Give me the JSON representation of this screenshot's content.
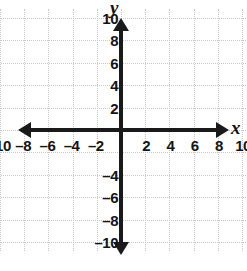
{
  "chart_data": {
    "type": "scatter",
    "title": "",
    "xlabel": "x",
    "ylabel": "y",
    "xlim": [
      -11,
      11
    ],
    "ylim": [
      -11,
      11
    ],
    "grid": true,
    "grid_step": 2,
    "legend": "none",
    "series": [],
    "x_tick_labels": [
      "–10",
      "–8",
      "–6",
      "–4",
      "–2",
      "2",
      "4",
      "6",
      "8",
      "10"
    ],
    "x_tick_values": [
      -10,
      -8,
      -6,
      -4,
      -2,
      2,
      4,
      6,
      8,
      10
    ],
    "y_tick_labels": [
      "10",
      "8",
      "6",
      "4",
      "2",
      "–4",
      "–6",
      "–8",
      "–10"
    ],
    "y_tick_values": [
      10,
      8,
      6,
      4,
      2,
      -4,
      -6,
      -8,
      -10
    ],
    "axis_color": "#1a1a1a",
    "grid_color": "#c9c9c9",
    "background": "#ffffff"
  },
  "axes": {
    "x_label": "x",
    "y_label": "y"
  },
  "ticks": {
    "x": [
      {
        "label": "–10",
        "value": -10
      },
      {
        "label": "–8",
        "value": -8
      },
      {
        "label": "–6",
        "value": -6
      },
      {
        "label": "–4",
        "value": -4
      },
      {
        "label": "–2",
        "value": -2
      },
      {
        "label": "2",
        "value": 2
      },
      {
        "label": "4",
        "value": 4
      },
      {
        "label": "6",
        "value": 6
      },
      {
        "label": "8",
        "value": 8
      },
      {
        "label": "10",
        "value": 10
      }
    ],
    "y": [
      {
        "label": "10",
        "value": 10
      },
      {
        "label": "8",
        "value": 8
      },
      {
        "label": "6",
        "value": 6
      },
      {
        "label": "4",
        "value": 4
      },
      {
        "label": "2",
        "value": 2
      },
      {
        "label": "–4",
        "value": -4
      },
      {
        "label": "–6",
        "value": -6
      },
      {
        "label": "–8",
        "value": -8
      },
      {
        "label": "–10",
        "value": -10
      }
    ]
  }
}
